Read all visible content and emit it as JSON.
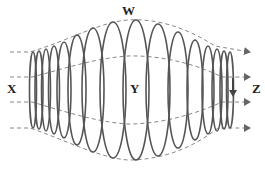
{
  "diagram": {
    "type": "helical coil with dashed field lines",
    "labels": {
      "w": "W",
      "x": "X",
      "y": "Y",
      "z": "Z"
    },
    "colors": {
      "coil": "#555555",
      "dashed": "#888888",
      "label": "#222222",
      "background": "#ffffff"
    },
    "arrows_right_count": 4,
    "current_arrow_direction": "down"
  }
}
